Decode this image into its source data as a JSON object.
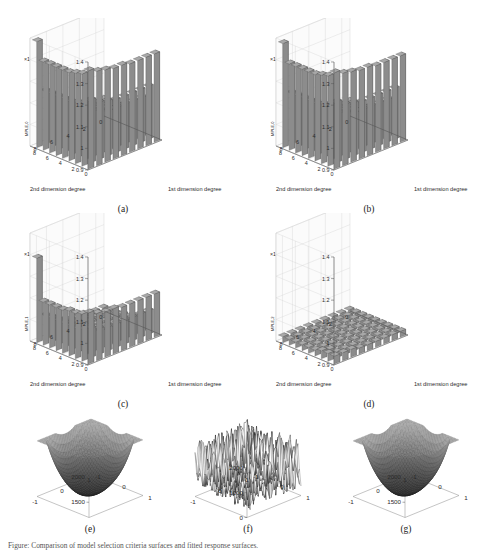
{
  "figure": {
    "caption": "Figure: Comparison of model selection criteria surfaces and fitted response surfaces.",
    "axis_exponent": "×10",
    "axis_exponent_power": "5",
    "xlabel": "1st dimension degree",
    "ylabel": "2nd dimension degree",
    "zlabel_base": "C",
    "zticks": [
      "0.9",
      "1",
      "1.1",
      "1.2",
      "1.3",
      "1.4"
    ],
    "xticks": [
      "0",
      "2",
      "4",
      "6",
      "8"
    ],
    "yticks": [
      "0",
      "2",
      "4",
      "6",
      "8"
    ],
    "surface_xticks": [
      "-1",
      "0",
      "1"
    ],
    "surface_yticks": [
      "-1",
      "0",
      "1"
    ]
  },
  "panels": [
    {
      "id": "a",
      "label": "(a)",
      "zlabel_sub": "MPLE,0",
      "type": "bar3d"
    },
    {
      "id": "b",
      "label": "(b)",
      "zlabel_sub": "MPLE,0",
      "type": "bar3d"
    },
    {
      "id": "c",
      "label": "(c)",
      "zlabel_sub": "MPLE,1",
      "type": "bar3d"
    },
    {
      "id": "d",
      "label": "(d)",
      "zlabel_sub": "MPLE,2",
      "type": "bar3d"
    },
    {
      "id": "e",
      "label": "(e)",
      "type": "surface",
      "ticks": [
        "1500",
        "2000"
      ]
    },
    {
      "id": "f",
      "label": "(f)",
      "type": "surface",
      "ticks": [
        "0",
        "1000",
        "2000"
      ]
    },
    {
      "id": "g",
      "label": "(g)",
      "type": "surface",
      "ticks": [
        "1500",
        "2000"
      ]
    }
  ],
  "colors": {
    "bar_face": "#8c8c8c",
    "bar_side": "#6e6e6e",
    "bar_top": "#a8a8a8",
    "grid": "#d0d0d0",
    "axis": "#555555",
    "surface_dark": "#3a3a3a",
    "surface_light": "#b5b5b5"
  },
  "chart_data": {
    "type": "bar",
    "xlabel": "1st dimension degree",
    "ylabel": "2nd dimension degree",
    "zlabel": "C_MPLE",
    "zlim": [
      0.9,
      1.45
    ],
    "z_scale": 100000,
    "x": [
      0,
      1,
      2,
      3,
      4,
      5,
      6,
      7,
      8
    ],
    "y": [
      0,
      1,
      2,
      3,
      4,
      5,
      6,
      7,
      8
    ],
    "grid_on": true,
    "legend": "none",
    "panels": [
      {
        "id": "a",
        "series_name": "C_MPLE,0 (panel a)",
        "note": "High ridge along first row/column, decaying toward interior; peak ~1.44e5",
        "values": [
          [
            1.4,
            1.38,
            1.37,
            1.36,
            1.36,
            1.35,
            1.35,
            1.35,
            1.35
          ],
          [
            1.37,
            1.22,
            1.19,
            1.18,
            1.17,
            1.17,
            1.17,
            1.17,
            1.17
          ],
          [
            1.36,
            1.19,
            1.13,
            1.11,
            1.1,
            1.1,
            1.1,
            1.1,
            1.1
          ],
          [
            1.35,
            1.18,
            1.11,
            1.07,
            1.06,
            1.05,
            1.05,
            1.05,
            1.05
          ],
          [
            1.35,
            1.17,
            1.1,
            1.06,
            1.04,
            1.03,
            1.03,
            1.03,
            1.03
          ],
          [
            1.35,
            1.17,
            1.1,
            1.05,
            1.03,
            1.02,
            1.02,
            1.02,
            1.02
          ],
          [
            1.35,
            1.17,
            1.1,
            1.05,
            1.03,
            1.02,
            1.01,
            1.01,
            1.01
          ],
          [
            1.35,
            1.17,
            1.1,
            1.05,
            1.03,
            1.02,
            1.01,
            1.01,
            1.01
          ],
          [
            1.44,
            1.17,
            1.1,
            1.05,
            1.03,
            1.02,
            1.01,
            1.01,
            1.01
          ]
        ]
      },
      {
        "id": "b",
        "series_name": "C_MPLE,0 (panel b)",
        "note": "Same structure as (a), marginally lower interior values",
        "values": [
          [
            1.39,
            1.37,
            1.36,
            1.35,
            1.35,
            1.34,
            1.34,
            1.34,
            1.34
          ],
          [
            1.36,
            1.21,
            1.18,
            1.17,
            1.16,
            1.16,
            1.16,
            1.16,
            1.16
          ],
          [
            1.35,
            1.18,
            1.12,
            1.1,
            1.09,
            1.09,
            1.09,
            1.09,
            1.09
          ],
          [
            1.34,
            1.17,
            1.1,
            1.06,
            1.05,
            1.04,
            1.04,
            1.04,
            1.04
          ],
          [
            1.34,
            1.16,
            1.09,
            1.05,
            1.03,
            1.02,
            1.02,
            1.02,
            1.02
          ],
          [
            1.34,
            1.16,
            1.09,
            1.04,
            1.02,
            1.01,
            1.01,
            1.01,
            1.01
          ],
          [
            1.34,
            1.16,
            1.09,
            1.04,
            1.02,
            1.01,
            1.0,
            1.0,
            1.0
          ],
          [
            1.34,
            1.16,
            1.09,
            1.04,
            1.02,
            1.01,
            1.0,
            1.0,
            1.0
          ],
          [
            1.43,
            1.16,
            1.09,
            1.04,
            1.02,
            1.01,
            1.0,
            1.0,
            1.0
          ]
        ]
      },
      {
        "id": "c",
        "series_name": "C_MPLE,1 (panel c)",
        "note": "Overall lower plateau; single spike at far corner ~1.33e5",
        "values": [
          [
            1.16,
            1.14,
            1.13,
            1.13,
            1.12,
            1.12,
            1.12,
            1.12,
            1.12
          ],
          [
            1.14,
            1.05,
            1.03,
            1.02,
            1.02,
            1.02,
            1.02,
            1.02,
            1.02
          ],
          [
            1.13,
            1.03,
            1.0,
            0.99,
            0.99,
            0.99,
            0.99,
            0.99,
            0.99
          ],
          [
            1.13,
            1.02,
            0.99,
            0.97,
            0.97,
            0.96,
            0.96,
            0.96,
            0.96
          ],
          [
            1.12,
            1.02,
            0.99,
            0.97,
            0.96,
            0.95,
            0.95,
            0.95,
            0.95
          ],
          [
            1.12,
            1.02,
            0.99,
            0.96,
            0.95,
            0.95,
            0.95,
            0.95,
            0.95
          ],
          [
            1.12,
            1.02,
            0.99,
            0.96,
            0.95,
            0.95,
            0.94,
            0.94,
            0.94
          ],
          [
            1.12,
            1.02,
            0.99,
            0.96,
            0.95,
            0.95,
            0.94,
            0.94,
            0.94
          ],
          [
            1.33,
            1.02,
            0.99,
            0.96,
            0.95,
            0.95,
            0.94,
            0.94,
            0.94
          ]
        ]
      },
      {
        "id": "d",
        "series_name": "C_MPLE,2 (panel d)",
        "note": "Flat low sheet across entire grid near 0.93e5",
        "values": [
          [
            0.94,
            0.94,
            0.94,
            0.93,
            0.93,
            0.93,
            0.93,
            0.93,
            0.93
          ],
          [
            0.94,
            0.93,
            0.93,
            0.93,
            0.93,
            0.93,
            0.93,
            0.93,
            0.93
          ],
          [
            0.94,
            0.93,
            0.93,
            0.93,
            0.93,
            0.93,
            0.93,
            0.93,
            0.93
          ],
          [
            0.93,
            0.93,
            0.93,
            0.93,
            0.93,
            0.93,
            0.93,
            0.93,
            0.93
          ],
          [
            0.93,
            0.93,
            0.93,
            0.93,
            0.93,
            0.93,
            0.93,
            0.93,
            0.93
          ],
          [
            0.93,
            0.93,
            0.93,
            0.93,
            0.93,
            0.93,
            0.93,
            0.93,
            0.93
          ],
          [
            0.93,
            0.93,
            0.93,
            0.93,
            0.93,
            0.93,
            0.93,
            0.93,
            0.93
          ],
          [
            0.93,
            0.93,
            0.93,
            0.93,
            0.93,
            0.93,
            0.93,
            0.93,
            0.93
          ],
          [
            0.93,
            0.93,
            0.93,
            0.93,
            0.93,
            0.93,
            0.93,
            0.93,
            0.93
          ]
        ]
      }
    ],
    "surfaces": [
      {
        "id": "e",
        "type": "surface",
        "title": "Smooth fitted surface",
        "xlim": [
          -1,
          1
        ],
        "ylim": [
          -1,
          1
        ],
        "zlim": [
          1200,
          2300
        ],
        "zticks": [
          1500,
          2000
        ],
        "description": "Bowl-shaped smooth surface with raised corners"
      },
      {
        "id": "f",
        "type": "surface",
        "title": "Noisy observed data",
        "xlim": [
          -1,
          1
        ],
        "ylim": [
          -1,
          1
        ],
        "zlim": [
          0,
          2500
        ],
        "zticks": [
          0,
          1000,
          2000
        ],
        "description": "High-frequency noise covering the domain"
      },
      {
        "id": "g",
        "type": "surface",
        "title": "Reconstructed smooth surface",
        "xlim": [
          -1,
          1
        ],
        "ylim": [
          -1,
          1
        ],
        "zlim": [
          1200,
          2300
        ],
        "zticks": [
          1500,
          2000
        ],
        "description": "Bowl-shaped smooth surface, matches (e)"
      }
    ]
  }
}
